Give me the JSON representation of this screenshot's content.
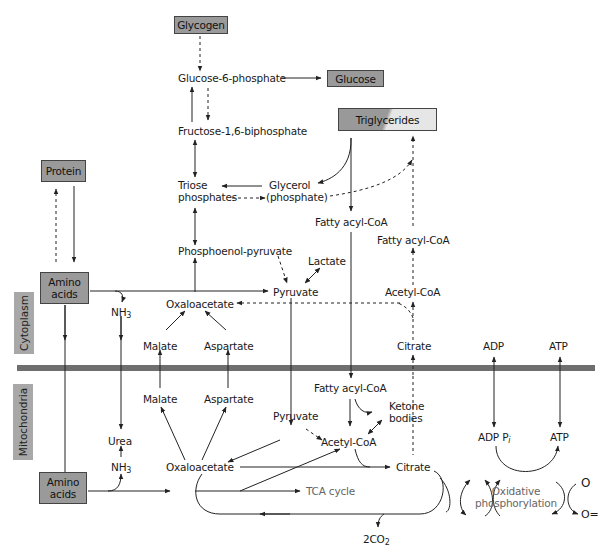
{
  "compartments": {
    "cytoplasm": "Cytoplasm",
    "mitochondria": "Mitochondria"
  },
  "boxes": {
    "glycogen": "Glycogen",
    "glucose": "Glucose",
    "triglycerides": "Triglycerides",
    "protein": "Protein",
    "amino_acids_cyto_line1": "Amino",
    "amino_acids_cyto_line2": "acids",
    "amino_acids_mito_line1": "Amino",
    "amino_acids_mito_line2": "acids"
  },
  "cytoplasm_nodes": {
    "glucose_6_phosphate": "Glucose-6-phosphate",
    "fructose_bisphosphate": "Fructose-1,6-biphosphate",
    "triose_line1": "Triose",
    "triose_line2": "phosphates",
    "glycerol_line1": "Glycerol",
    "glycerol_line2": "(phosphate)",
    "fatty_acyl_coa_1": "Fatty acyl-CoA",
    "fatty_acyl_coa_2": "Fatty acyl-CoA",
    "pep": "Phosphoenol-pyruvate",
    "lactate": "Lactate",
    "pyruvate": "Pyruvate",
    "acetyl_coa": "Acetyl-CoA",
    "oxaloacetate": "Oxaloacetate",
    "nh3_base": "NH",
    "nh3_sub": "3",
    "malate": "Malate",
    "aspartate": "Aspartate",
    "citrate": "Citrate",
    "adp": "ADP",
    "atp": "ATP"
  },
  "mitochondria_nodes": {
    "fatty_acyl_coa": "Fatty acyl-CoA",
    "ketone_line1": "Ketone",
    "ketone_line2": "bodies",
    "malate": "Malate",
    "aspartate": "Aspartate",
    "pyruvate": "Pyruvate",
    "acetyl_coa": "Acetyl-CoA",
    "urea": "Urea",
    "nh3_base": "NH",
    "nh3_sub": "3",
    "oxaloacetate": "Oxaloacetate",
    "citrate": "Citrate",
    "tca_cycle": "TCA cycle",
    "co2_base": "2CO",
    "co2_sub": "2",
    "adp_pi": "ADP P",
    "adp_pi_sub": "i",
    "atp": "ATP",
    "oxphos_line1": "Oxidative",
    "oxphos_line2": "phosphorylation",
    "oxygen": "O",
    "oxide": "O="
  },
  "colors": {
    "box_fill": "#9a9a9a",
    "membrane": "#6e6e6e",
    "side_label_fill": "#a8a8a8",
    "line": "#222222",
    "grey_text": "#666666"
  }
}
